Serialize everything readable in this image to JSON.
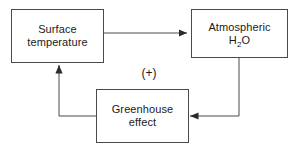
{
  "diagram": {
    "background_color": "#ffffff",
    "line_color": "#4a4a4a",
    "text_color": "#1a1a1a",
    "nodes": [
      {
        "id": "surface-temperature",
        "label_line_1": "Surface",
        "label_line_2": "temperature"
      },
      {
        "id": "atmospheric-h2o",
        "label_line_1": "Atmospheric",
        "formula_prefix": "H",
        "formula_subscript": "2",
        "formula_suffix": "O"
      },
      {
        "id": "greenhouse-effect",
        "label_line_1": "Greenhouse",
        "label_line_2": "effect"
      }
    ],
    "annotations": {
      "feedback_sign": "(+)"
    }
  }
}
